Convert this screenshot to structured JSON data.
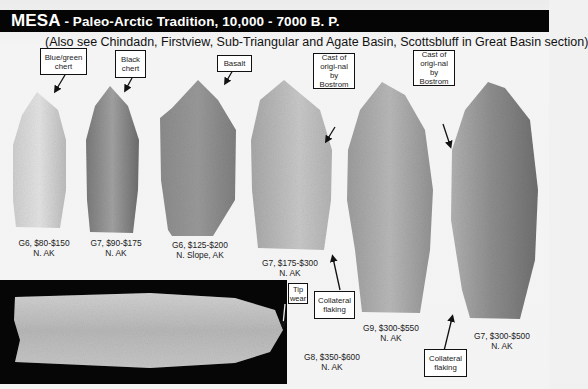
{
  "header": {
    "title_main": "MESA",
    "title_sub": " - Paleo-Arctic Tradition, 10,000 - 7000 B. P.",
    "subtitle": "(Also see Chindadn, Firstview, Sub-Triangular and Agate Basin, Scottsbluff in Great Basin section)"
  },
  "callouts": [
    {
      "id": "blue-green-chert",
      "text": "Blue/green chert"
    },
    {
      "id": "black-chert",
      "text": "Black chert"
    },
    {
      "id": "basalt",
      "text": "Basalt"
    },
    {
      "id": "cast-bostrom-1",
      "text": "Cast of origi-nal by Bostrom"
    },
    {
      "id": "cast-bostrom-2",
      "text": "Cast of origi-nal by Bostrom"
    },
    {
      "id": "collateral-flaking-1",
      "text": "Collateral flaking"
    },
    {
      "id": "collateral-flaking-2",
      "text": "Collateral flaking"
    },
    {
      "id": "tip-wear",
      "text": "Tip wear"
    }
  ],
  "artifacts": [
    {
      "grade_price": "G6, $80-$150",
      "location": "N. AK",
      "material": "Blue/green chert"
    },
    {
      "grade_price": "G7, $90-$175",
      "location": "N. AK",
      "material": "Black chert"
    },
    {
      "grade_price": "G6, $125-$200",
      "location": "N. Slope, AK",
      "material": "Basalt"
    },
    {
      "grade_price": "G7, $175-$300",
      "location": "N. AK",
      "material": "Cast of original by Bostrom"
    },
    {
      "grade_price": "G9, $300-$550",
      "location": "N. AK",
      "material": ""
    },
    {
      "grade_price": "G7, $300-$500",
      "location": "N. AK",
      "material": "Cast of original by Bostrom"
    },
    {
      "grade_price": "G8, $350-$600",
      "location": "N. AK",
      "material": ""
    }
  ],
  "colors": {
    "banner": "#050505",
    "banner_text": "#ffffff",
    "background": "#f2f2f2",
    "stone_light": "#c8c8c8",
    "stone_dark": "#6e6e6e"
  }
}
